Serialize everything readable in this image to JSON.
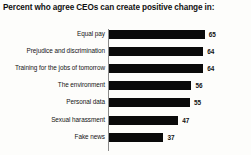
{
  "chart_data": {
    "type": "bar",
    "orientation": "horizontal",
    "title": "Percent who agree CEOs can create positive change in:",
    "xlabel": "",
    "ylabel": "",
    "xlim": [
      0,
      70
    ],
    "grid": false,
    "legend": false,
    "bar_color": "#0a0a0a",
    "background_color": "#fdfdfb",
    "categories": [
      "Equal pay",
      "Prejudice and discrimination",
      "Training for the jobs of tomorrow",
      "The environment",
      "Personal data",
      "Sexual harassment",
      "Fake news"
    ],
    "values": [
      65,
      64,
      64,
      56,
      55,
      47,
      37
    ],
    "value_labels": [
      "65",
      "64",
      "64",
      "56",
      "55",
      "47",
      "37"
    ]
  }
}
